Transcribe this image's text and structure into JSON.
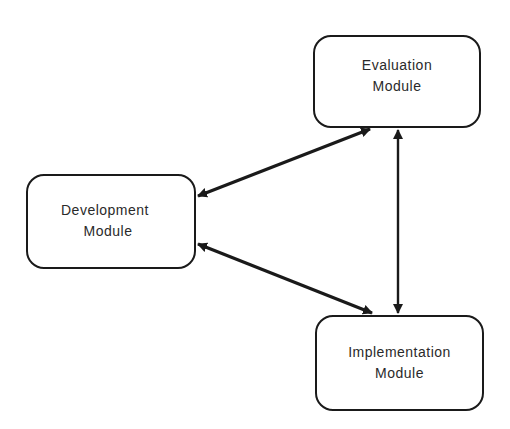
{
  "diagram": {
    "type": "flow",
    "nodes": [
      {
        "id": "evaluation",
        "lines": [
          "Evaluation",
          "Module"
        ]
      },
      {
        "id": "development",
        "lines": [
          "Development",
          "Module"
        ]
      },
      {
        "id": "implementation",
        "lines": [
          "Implementation",
          "Module"
        ]
      }
    ],
    "edges": [
      {
        "from": "development",
        "to": "evaluation",
        "direction": "bidirectional"
      },
      {
        "from": "development",
        "to": "implementation",
        "direction": "bidirectional"
      },
      {
        "from": "evaluation",
        "to": "implementation",
        "direction": "bidirectional"
      }
    ],
    "colors": {
      "stroke": "#1a1a1a",
      "text": "#2a2a2a",
      "background": "#ffffff"
    }
  }
}
